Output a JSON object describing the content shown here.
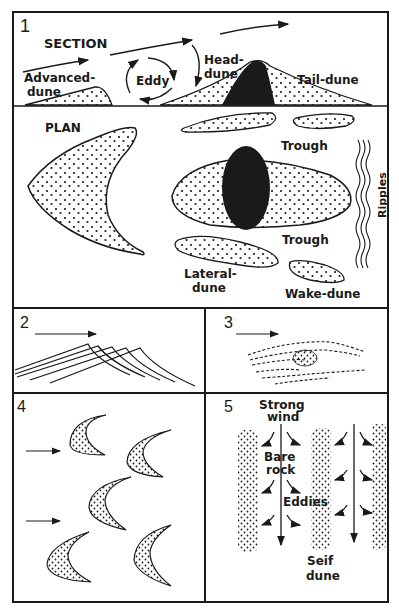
{
  "figure": {
    "panels": [
      {
        "number": "1",
        "section_title": "SECTION",
        "plan_title": "PLAN",
        "labels": {
          "advanced_dune": [
            "Advanced-",
            "dune"
          ],
          "eddy": "Eddy",
          "head_dune": [
            "Head-",
            "dune"
          ],
          "tail_dune": "Tail-dune",
          "trough_top": "Trough",
          "trough_bottom": "Trough",
          "ripples": "Ripples",
          "lateral_dune": [
            "Lateral-",
            "dune"
          ],
          "wake_dune": "Wake-dune"
        }
      },
      {
        "number": "2"
      },
      {
        "number": "3"
      },
      {
        "number": "4"
      },
      {
        "number": "5",
        "labels": {
          "strong_wind": [
            "Strong",
            "wind"
          ],
          "bare_rock": [
            "Bare",
            "rock"
          ],
          "eddies": "Eddies",
          "seif_dune": [
            "Seif",
            "dune"
          ]
        }
      }
    ],
    "colors": {
      "ink": "#1a1a1a",
      "paper": "#ffffff"
    }
  }
}
